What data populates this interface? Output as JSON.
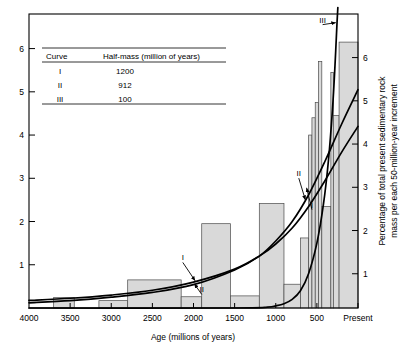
{
  "chart_data": {
    "type": "bar",
    "title": "",
    "subtitle": "",
    "xlabel": "Age (millions of years)",
    "ylabel_left": "",
    "ylabel_right": "Percentage of total present sedimentary rock mass per each 50-million-year increment",
    "xlim": [
      4000,
      0
    ],
    "ylim": [
      0,
      6.8
    ],
    "x_tick_labels": [
      "4000",
      "3500",
      "3000",
      "2500",
      "2000",
      "1500",
      "1000",
      "500",
      "Present"
    ],
    "x_tick_values": [
      4000,
      3500,
      3000,
      2500,
      2000,
      1500,
      1000,
      500,
      0
    ],
    "y_tick_labels_left": [
      "1",
      "2",
      "3",
      "4",
      "5",
      "6"
    ],
    "y_tick_values_left": [
      1,
      2,
      3,
      4,
      5,
      6
    ],
    "y_tick_labels_right": [
      "1",
      "2",
      "3",
      "4",
      "5",
      "6"
    ],
    "y_tick_values_right": [
      1,
      2,
      3,
      4,
      5,
      6
    ],
    "grid": false,
    "legend_position": "upper-left-inset",
    "bar_fill_color": "#d9d9d9",
    "bar_edge_color": "#4a4a4a",
    "curve_color": "#000000",
    "histogram": {
      "note": "Stepped histogram of percentage of present sedimentary rock mass per 50-million-year increment versus age.",
      "bins": [
        {
          "x_start": 4000,
          "x_end": 3700,
          "value": 0.0
        },
        {
          "x_start": 3700,
          "x_end": 3450,
          "value": 0.24
        },
        {
          "x_start": 3450,
          "x_end": 3150,
          "value": 0.0
        },
        {
          "x_start": 3150,
          "x_end": 2800,
          "value": 0.17
        },
        {
          "x_start": 2800,
          "x_end": 2150,
          "value": 0.65
        },
        {
          "x_start": 2150,
          "x_end": 1900,
          "value": 0.26
        },
        {
          "x_start": 1900,
          "x_end": 1550,
          "value": 1.95
        },
        {
          "x_start": 1550,
          "x_end": 1200,
          "value": 0.28
        },
        {
          "x_start": 1200,
          "x_end": 900,
          "value": 2.42
        },
        {
          "x_start": 900,
          "x_end": 700,
          "value": 0.55
        },
        {
          "x_start": 700,
          "x_end": 600,
          "value": 1.62
        },
        {
          "x_start": 600,
          "x_end": 560,
          "value": 4.0
        },
        {
          "x_start": 560,
          "x_end": 520,
          "value": 4.4
        },
        {
          "x_start": 520,
          "x_end": 480,
          "value": 4.75
        },
        {
          "x_start": 480,
          "x_end": 440,
          "value": 5.7
        },
        {
          "x_start": 440,
          "x_end": 330,
          "value": 2.35
        },
        {
          "x_start": 330,
          "x_end": 300,
          "value": 5.45
        },
        {
          "x_start": 300,
          "x_end": 230,
          "value": 4.45
        },
        {
          "x_start": 230,
          "x_end": 0,
          "value": 6.15
        }
      ]
    },
    "series": [
      {
        "name": "I",
        "label": "I",
        "half_mass_million_years": 1200,
        "kind": "exponential-decay-curve",
        "points": [
          {
            "x": 4000,
            "y": 0.175
          },
          {
            "x": 3500,
            "y": 0.225
          },
          {
            "x": 3000,
            "y": 0.3
          },
          {
            "x": 2500,
            "y": 0.41
          },
          {
            "x": 2000,
            "y": 0.6
          },
          {
            "x": 1500,
            "y": 0.9
          },
          {
            "x": 1200,
            "y": 1.2
          },
          {
            "x": 1000,
            "y": 1.48
          },
          {
            "x": 800,
            "y": 1.85
          },
          {
            "x": 600,
            "y": 2.35
          },
          {
            "x": 400,
            "y": 2.95
          },
          {
            "x": 200,
            "y": 3.6
          },
          {
            "x": 0,
            "y": 4.2
          }
        ]
      },
      {
        "name": "II",
        "label": "II",
        "half_mass_million_years": 912,
        "kind": "exponential-decay-curve",
        "points": [
          {
            "x": 4000,
            "y": 0.12
          },
          {
            "x": 3500,
            "y": 0.17
          },
          {
            "x": 3000,
            "y": 0.25
          },
          {
            "x": 2500,
            "y": 0.36
          },
          {
            "x": 2000,
            "y": 0.54
          },
          {
            "x": 1500,
            "y": 0.88
          },
          {
            "x": 1200,
            "y": 1.2
          },
          {
            "x": 1000,
            "y": 1.55
          },
          {
            "x": 800,
            "y": 2.0
          },
          {
            "x": 600,
            "y": 2.62
          },
          {
            "x": 400,
            "y": 3.4
          },
          {
            "x": 200,
            "y": 4.25
          },
          {
            "x": 0,
            "y": 5.05
          }
        ]
      },
      {
        "name": "III",
        "label": "III",
        "half_mass_million_years": 100,
        "kind": "exponential-decay-curve",
        "points": [
          {
            "x": 4000,
            "y": 0.0
          },
          {
            "x": 1500,
            "y": 0.0
          },
          {
            "x": 1100,
            "y": 0.02
          },
          {
            "x": 1000,
            "y": 0.05
          },
          {
            "x": 900,
            "y": 0.1
          },
          {
            "x": 800,
            "y": 0.2
          },
          {
            "x": 700,
            "y": 0.4
          },
          {
            "x": 600,
            "y": 0.8
          },
          {
            "x": 500,
            "y": 1.5
          },
          {
            "x": 420,
            "y": 2.4
          },
          {
            "x": 360,
            "y": 3.4
          },
          {
            "x": 310,
            "y": 4.6
          },
          {
            "x": 280,
            "y": 5.6
          },
          {
            "x": 255,
            "y": 6.6
          },
          {
            "x": 245,
            "y": 6.95
          }
        ]
      }
    ],
    "annotations": [
      {
        "text": "I",
        "x": 2130,
        "y": 1.1,
        "target_x": 1980,
        "target_y": 0.63
      },
      {
        "text": "II",
        "x": 1900,
        "y": 0.36,
        "target_x": 1990,
        "target_y": 0.56
      },
      {
        "text": "II",
        "x": 720,
        "y": 3.05,
        "target_x": 640,
        "target_y": 2.5
      },
      {
        "text": "I",
        "x": 560,
        "y": 2.32,
        "target_x": 625,
        "target_y": 2.78
      },
      {
        "text": "III",
        "x": 430,
        "y": 6.6,
        "target_x": 270,
        "target_y": 6.6
      }
    ]
  },
  "legend": {
    "headers": [
      "Curve",
      "Half-mass (million of years)"
    ],
    "rows": [
      {
        "curve": "I",
        "half_mass": "1200"
      },
      {
        "curve": "II",
        "half_mass": "912"
      },
      {
        "curve": "III",
        "half_mass": "100"
      }
    ]
  },
  "axes": {
    "x_title": "Age (millions of years)",
    "y_right_line1": "Percentage of total present sedimentary rock",
    "y_right_line2": "mass per each 50-million-year increment"
  }
}
